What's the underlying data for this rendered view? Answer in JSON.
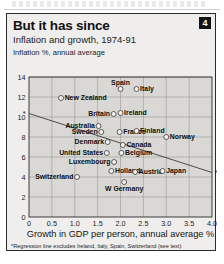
{
  "card": {
    "title": "But it has since",
    "subtitle": "Inflation and growth, 1974-91",
    "badge": "4",
    "footnote": "*Regression line excludes Ireland, Italy, Spain, Switzerland (see text)"
  },
  "colors": {
    "card_background": "#efeeec",
    "plot_background": "#d9d8d4",
    "frame": "#2b2b2b",
    "grid": "#8d8d89",
    "dot_fill": "#f2f1ef",
    "dot_stroke": "#3a3a3a",
    "badge_background": "#141414",
    "badge_text": "#ffffff"
  },
  "chart_data": {
    "type": "scatter",
    "title": "But it has since",
    "subtitle": "Inflation and growth, 1974-91",
    "xlabel": "Growth in GDP per person, annual average %",
    "ylabel": "Inflation %, annual average",
    "xlim": [
      0,
      4.0
    ],
    "ylim": [
      0,
      14
    ],
    "xticks": [
      "0",
      "0.5",
      "1.0",
      "1.5",
      "2.0",
      "2.5",
      "3.0",
      "3.5",
      "4.0"
    ],
    "xtick_values": [
      0,
      0.5,
      1.0,
      1.5,
      2.0,
      2.5,
      3.0,
      3.5,
      4.0
    ],
    "yticks": [
      "0",
      "2",
      "4",
      "6",
      "8",
      "10",
      "12",
      "14"
    ],
    "ytick_values": [
      0,
      2,
      4,
      6,
      8,
      10,
      12,
      14
    ],
    "grid": true,
    "legend": "none",
    "points": [
      {
        "label": "New Zealand",
        "x": 0.7,
        "y": 11.9,
        "label_side": "right"
      },
      {
        "label": "Spain",
        "x": 2.0,
        "y": 12.8,
        "label_side": "above"
      },
      {
        "label": "Italy",
        "x": 2.35,
        "y": 12.8,
        "label_side": "right"
      },
      {
        "label": "Britain",
        "x": 1.85,
        "y": 10.3,
        "label_side": "left"
      },
      {
        "label": "Ireland",
        "x": 2.0,
        "y": 10.4,
        "label_side": "right"
      },
      {
        "label": "Australia",
        "x": 1.52,
        "y": 9.1,
        "label_side": "left"
      },
      {
        "label": "Sweden",
        "x": 1.58,
        "y": 8.5,
        "label_side": "left"
      },
      {
        "label": "France",
        "x": 1.98,
        "y": 8.5,
        "label_side": "right"
      },
      {
        "label": "Finland",
        "x": 2.35,
        "y": 8.6,
        "label_side": "right"
      },
      {
        "label": "Norway",
        "x": 3.0,
        "y": 8.0,
        "label_side": "right"
      },
      {
        "label": "Denmark",
        "x": 1.72,
        "y": 7.5,
        "label_side": "left"
      },
      {
        "label": "Canada",
        "x": 2.05,
        "y": 7.2,
        "label_side": "right"
      },
      {
        "label": "United States",
        "x": 1.7,
        "y": 6.4,
        "label_side": "left"
      },
      {
        "label": "Belgium",
        "x": 2.02,
        "y": 6.4,
        "label_side": "right"
      },
      {
        "label": "Luxembourg",
        "x": 1.86,
        "y": 5.5,
        "label_side": "left"
      },
      {
        "label": "Holland",
        "x": 1.8,
        "y": 4.6,
        "label_side": "right"
      },
      {
        "label": "Austria",
        "x": 2.32,
        "y": 4.5,
        "label_side": "right"
      },
      {
        "label": "Japan",
        "x": 2.92,
        "y": 4.6,
        "label_side": "right"
      },
      {
        "label": "Switzerland",
        "x": 1.05,
        "y": 4.0,
        "label_side": "left"
      },
      {
        "label": "W Germany",
        "x": 2.08,
        "y": 3.5,
        "label_side": "below"
      }
    ],
    "regression_line": {
      "note": "*Regression line excludes Ireland, Italy, Spain, Switzerland (see text)",
      "x_start": 0.0,
      "y_start": 10.35,
      "x_end": 4.0,
      "y_end": 4.45
    }
  }
}
